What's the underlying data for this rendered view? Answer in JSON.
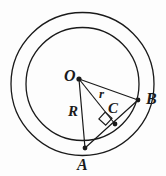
{
  "figure": {
    "kind": "geometry-diagram",
    "width": 166,
    "height": 176,
    "background_color": "#fdfdfd",
    "stroke_color": "#1a1a1a",
    "label_color": "#1a1a1a"
  },
  "shapes": {
    "outer_circle": {
      "cx": 82.5,
      "cy": 84,
      "r": 71.5,
      "stroke_width": 1.3
    },
    "inner_circle": {
      "cx": 82.5,
      "cy": 84,
      "r": 56.5,
      "stroke_width": 1.3
    }
  },
  "points": {
    "O": {
      "x": 79,
      "y": 79,
      "label": "O",
      "label_x": 64,
      "label_y": 68,
      "dot_r": 2.6
    },
    "A": {
      "x": 85,
      "y": 148,
      "label": "A",
      "label_x": 77,
      "label_y": 157,
      "dot_r": 2.4
    },
    "B": {
      "x": 138,
      "y": 100,
      "label": "B",
      "label_x": 146,
      "label_y": 91,
      "dot_r": 2.4
    },
    "C": {
      "x": 115,
      "y": 124,
      "label": "C",
      "label_x": 108,
      "label_y": 101,
      "dot_r": 2.4
    }
  },
  "segments": {
    "OB": {
      "x1": 79,
      "y1": 79,
      "x2": 138,
      "y2": 100,
      "stroke_width": 1.2
    },
    "OA": {
      "x1": 79,
      "y1": 79,
      "x2": 85,
      "y2": 148,
      "stroke_width": 1.2,
      "label": "R",
      "label_x": 68,
      "label_y": 104
    },
    "OC": {
      "x1": 79,
      "y1": 79,
      "x2": 115,
      "y2": 124,
      "stroke_width": 1.2,
      "label": "r",
      "label_x": 99,
      "label_y": 87
    },
    "AB": {
      "x1": 85,
      "y1": 148,
      "x2": 138,
      "y2": 100,
      "stroke_width": 1.2
    }
  },
  "right_angle_marker": {
    "at_point": "C",
    "points": "105.2,112.1 112.0,118.4 105.7,125.2 98.9,118.9",
    "stroke_width": 1.2
  },
  "labels": {
    "center": "O",
    "chord_end_a": "A",
    "chord_end_b": "B",
    "foot_of_perpendicular": "C",
    "big_radius": "R",
    "small_radius": "r"
  }
}
